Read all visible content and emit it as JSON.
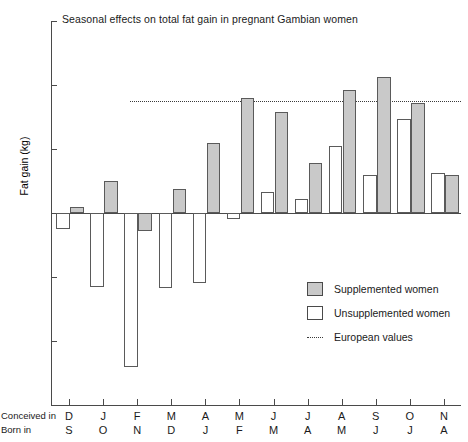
{
  "chart_data": {
    "type": "bar",
    "title": "Seasonal effects on total fat gain in pregnant Gambian women",
    "xlabel": "",
    "ylabel": "Fat gain (kg)",
    "ylim": [
      -6,
      6
    ],
    "yticks": [
      "+6",
      "+4",
      "+2",
      "0",
      "-2",
      "-4",
      "-6"
    ],
    "ytick_values": [
      6,
      4,
      2,
      0,
      -2,
      -4,
      -6
    ],
    "grid": false,
    "legend_position": "inside-right",
    "row_labels": {
      "conceived": "Conceived in",
      "born": "Born in"
    },
    "categories": [
      {
        "conceived": "D",
        "born": "S"
      },
      {
        "conceived": "J",
        "born": "O"
      },
      {
        "conceived": "F",
        "born": "N"
      },
      {
        "conceived": "M",
        "born": "D"
      },
      {
        "conceived": "A",
        "born": "J"
      },
      {
        "conceived": "M",
        "born": "F"
      },
      {
        "conceived": "J",
        "born": "M"
      },
      {
        "conceived": "J",
        "born": "A"
      },
      {
        "conceived": "A",
        "born": "M"
      },
      {
        "conceived": "S",
        "born": "J"
      },
      {
        "conceived": "O",
        "born": "J"
      },
      {
        "conceived": "N",
        "born": "A"
      }
    ],
    "series": [
      {
        "name": "Unsupplemented women",
        "color": "#ffffff",
        "values": [
          -0.5,
          -2.3,
          -4.8,
          -2.35,
          -2.2,
          -0.2,
          0.65,
          0.45,
          2.1,
          1.2,
          2.95,
          1.25
        ]
      },
      {
        "name": "Supplemented women",
        "color": "#c9c9c9",
        "values": [
          0.2,
          1.0,
          -0.55,
          0.75,
          2.2,
          3.6,
          3.15,
          1.55,
          3.85,
          4.25,
          3.45,
          1.2
        ]
      }
    ],
    "reference_line": {
      "name": "European values",
      "value": 3.5,
      "style": "dotted",
      "color": "#3a3a3a"
    }
  },
  "legend": {
    "items": [
      {
        "label": "Supplemented women",
        "kind": "supp"
      },
      {
        "label": "Unsupplemented women",
        "kind": "unsupp"
      },
      {
        "label": "European values",
        "kind": "dotted"
      }
    ]
  }
}
